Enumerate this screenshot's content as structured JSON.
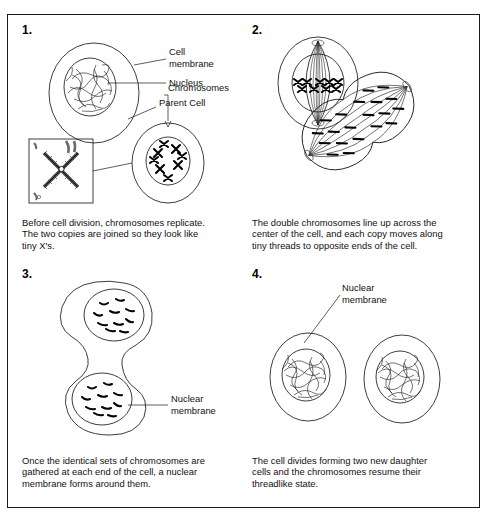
{
  "diagram": {
    "background": "#ffffff",
    "line_color": "#1a1a1a",
    "panels": [
      {
        "number": "1.",
        "labels": [
          {
            "name": "cell-membrane",
            "text": "Cell\nmembrane"
          },
          {
            "name": "nucleus",
            "text": "Nucleus"
          },
          {
            "name": "parent-cell",
            "text": "Parent Cell"
          },
          {
            "name": "chromosomes",
            "text": "Chromosomes"
          }
        ],
        "caption": "Before cell division, chromosomes replicate.\nThe two copies are joined so they look like\ntiny X's."
      },
      {
        "number": "2.",
        "labels": [],
        "caption": "The double chromosomes line up across the\ncenter of the cell, and each copy moves along\ntiny threads to opposite ends of the cell."
      },
      {
        "number": "3.",
        "labels": [
          {
            "name": "nuclear-membrane",
            "text": "Nuclear\nmembrane"
          }
        ],
        "caption": "Once the identical sets of chromosomes are\ngathered at each end of the cell, a nuclear\nmembrane forms around them."
      },
      {
        "number": "4.",
        "labels": [
          {
            "name": "nuclear-membrane",
            "text": "Nuclear\nmembrane"
          }
        ],
        "caption": "The cell divides forming two new daughter\ncells and the chromosomes resume their\nthreadlike state."
      }
    ]
  }
}
